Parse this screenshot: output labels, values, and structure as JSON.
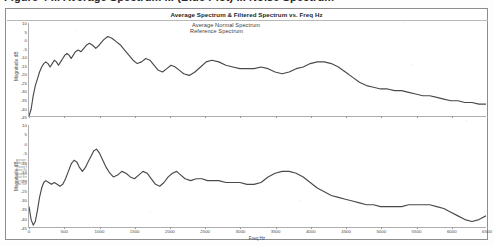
{
  "document": {
    "caption": "Figure 4 ... Average Spectrum ... (Blue Plot) ... Noise Spectrum"
  },
  "chart": {
    "title": "Average Spectrum & Filtered Spectrum vs. Freq Hz",
    "xlabel": "Freq Hz",
    "ylabel": "Magnitude dB",
    "line_color": "#4a4a4a",
    "frame_color": "#8d8d8d",
    "grid": false,
    "legend_strip": [
      "Average Normal Spectrum",
      "Reference Spectrum",
      "Filtered Spectrum",
      "Noise Floor",
      "Band Average",
      "Peak Envelope",
      "Smoothed Trace",
      "Raw Samples"
    ]
  },
  "chart_data": [
    {
      "type": "line",
      "name": "top-panel",
      "title": "Average Normal Spectrum",
      "xlabel": "Freq Hz",
      "ylabel": "Magnitude dB",
      "xlim": [
        0,
        6500
      ],
      "ylim": [
        -45,
        10
      ],
      "xticks": [
        0,
        500,
        1000,
        1500,
        2000,
        2500,
        3000,
        3500,
        4000,
        4500,
        5000,
        5500,
        6000,
        6500
      ],
      "yticks": [
        10,
        5,
        0,
        -5,
        -10,
        -15,
        -20,
        -25,
        -30,
        -35,
        -40,
        -45
      ],
      "grid": false,
      "legend": [
        "Average Normal Spectrum"
      ],
      "x": [
        0,
        30,
        60,
        90,
        120,
        150,
        180,
        210,
        240,
        270,
        300,
        330,
        360,
        390,
        420,
        450,
        480,
        510,
        540,
        570,
        600,
        630,
        660,
        700,
        740,
        780,
        820,
        860,
        900,
        950,
        1000,
        1060,
        1120,
        1180,
        1240,
        1300,
        1360,
        1420,
        1480,
        1540,
        1600,
        1660,
        1720,
        1780,
        1840,
        1900,
        1960,
        2020,
        2080,
        2140,
        2200,
        2280,
        2360,
        2440,
        2520,
        2600,
        2700,
        2800,
        2900,
        3000,
        3100,
        3200,
        3300,
        3400,
        3500,
        3600,
        3700,
        3800,
        3900,
        4000,
        4100,
        4200,
        4300,
        4400,
        4500,
        4600,
        4700,
        4800,
        4900,
        5000,
        5100,
        5200,
        5300,
        5400,
        5500,
        5600,
        5700,
        5800,
        5900,
        6000,
        6100,
        6200,
        6300,
        6400,
        6500
      ],
      "y": [
        -45,
        -41,
        -33,
        -27,
        -23,
        -19,
        -16,
        -14,
        -13,
        -14,
        -16,
        -14,
        -12,
        -13,
        -15,
        -13,
        -11,
        -9,
        -8,
        -9,
        -11,
        -9,
        -7,
        -6,
        -7,
        -5,
        -3,
        -2,
        -3,
        -5,
        -3,
        0,
        2,
        1,
        -1,
        -3,
        -6,
        -9,
        -12,
        -14,
        -13,
        -11,
        -12,
        -15,
        -18,
        -19,
        -17,
        -15,
        -16,
        -18,
        -20,
        -21,
        -19,
        -16,
        -13,
        -12,
        -13,
        -15,
        -16,
        -17,
        -17,
        -17,
        -16,
        -17,
        -19,
        -20,
        -19,
        -17,
        -16,
        -14,
        -13,
        -13,
        -14,
        -16,
        -19,
        -22,
        -25,
        -27,
        -28,
        -29,
        -29,
        -30,
        -30,
        -31,
        -32,
        -33,
        -33,
        -34,
        -35,
        -36,
        -36,
        -37,
        -37,
        -38,
        -38,
        -37
      ]
    },
    {
      "type": "line",
      "name": "bottom-panel",
      "title": "Reference Spectrum",
      "xlabel": "Freq Hz",
      "ylabel": "Magnitude dB",
      "xlim": [
        0,
        6500
      ],
      "ylim": [
        -45,
        10
      ],
      "xticks": [
        0,
        500,
        1000,
        1500,
        2000,
        2500,
        3000,
        3500,
        4000,
        4500,
        5000,
        5500,
        6000,
        6500
      ],
      "yticks": [
        10,
        5,
        0,
        -5,
        -10,
        -15,
        -20,
        -25,
        -30,
        -35,
        -40,
        -45
      ],
      "grid": false,
      "legend": [
        "Reference Spectrum"
      ],
      "x": [
        0,
        30,
        60,
        90,
        120,
        150,
        180,
        210,
        240,
        280,
        320,
        360,
        400,
        440,
        480,
        520,
        560,
        600,
        640,
        680,
        720,
        760,
        800,
        840,
        880,
        920,
        960,
        1000,
        1050,
        1100,
        1150,
        1200,
        1260,
        1320,
        1380,
        1440,
        1500,
        1560,
        1620,
        1680,
        1740,
        1800,
        1860,
        1920,
        1980,
        2040,
        2100,
        2160,
        2220,
        2300,
        2380,
        2460,
        2540,
        2620,
        2700,
        2800,
        2900,
        3000,
        3100,
        3200,
        3300,
        3400,
        3500,
        3600,
        3700,
        3800,
        3900,
        4000,
        4100,
        4200,
        4300,
        4400,
        4500,
        4600,
        4700,
        4800,
        4900,
        5000,
        5100,
        5200,
        5300,
        5400,
        5500,
        5600,
        5700,
        5800,
        5900,
        6000,
        6100,
        6200,
        6300,
        6400,
        6500
      ],
      "y": [
        -34,
        -41,
        -44,
        -42,
        -36,
        -29,
        -24,
        -21,
        -20,
        -21,
        -22,
        -21,
        -22,
        -23,
        -22,
        -19,
        -15,
        -11,
        -9,
        -10,
        -13,
        -15,
        -13,
        -10,
        -7,
        -4,
        -3,
        -5,
        -9,
        -13,
        -16,
        -18,
        -17,
        -15,
        -16,
        -18,
        -19,
        -17,
        -15,
        -16,
        -19,
        -22,
        -23,
        -21,
        -18,
        -16,
        -15,
        -17,
        -19,
        -20,
        -19,
        -19,
        -20,
        -20,
        -20,
        -21,
        -21,
        -21,
        -22,
        -22,
        -21,
        -18,
        -16,
        -15,
        -15,
        -16,
        -18,
        -21,
        -24,
        -26,
        -28,
        -29,
        -30,
        -31,
        -32,
        -33,
        -33,
        -34,
        -34,
        -34,
        -34,
        -33,
        -33,
        -33,
        -33,
        -34,
        -35,
        -37,
        -39,
        -41,
        -42,
        -41,
        -39,
        -36,
        -33,
        -32
      ]
    }
  ]
}
